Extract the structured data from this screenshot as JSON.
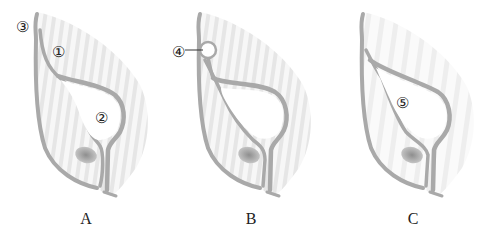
{
  "figures": [
    {
      "id": "A",
      "caption": "A",
      "labels": [
        {
          "text": "③",
          "x": 22,
          "y": 27
        },
        {
          "text": "①",
          "x": 58,
          "y": 52
        },
        {
          "text": "②",
          "x": 101,
          "y": 118
        }
      ]
    },
    {
      "id": "B",
      "caption": "B",
      "labels": [
        {
          "text": "④",
          "x": 178,
          "y": 52
        }
      ]
    },
    {
      "id": "C",
      "caption": "C",
      "labels": [
        {
          "text": "⑤",
          "x": 402,
          "y": 103
        }
      ]
    }
  ],
  "colors": {
    "wall": "#a9a9a9",
    "stripe": "#e4e4e4",
    "cell_fill": "#f6f6f6",
    "nucleus": "#9a9a9a",
    "text": "#222222"
  }
}
